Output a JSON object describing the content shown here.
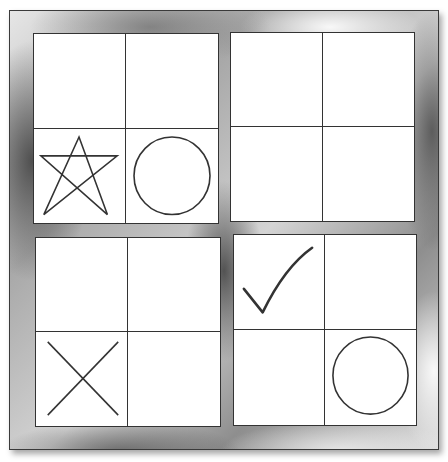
{
  "diagram": {
    "type": "grid-puzzle",
    "frame_color": "#a0a0a0",
    "line_color": "#333333",
    "quadrants": [
      {
        "id": "top-left",
        "cells": [
          {
            "position": "top-left",
            "symbol": ""
          },
          {
            "position": "top-right",
            "symbol": ""
          },
          {
            "position": "bottom-left",
            "symbol": "star"
          },
          {
            "position": "bottom-right",
            "symbol": "circle"
          }
        ]
      },
      {
        "id": "top-right",
        "cells": [
          {
            "position": "top-left",
            "symbol": ""
          },
          {
            "position": "top-right",
            "symbol": ""
          },
          {
            "position": "bottom-left",
            "symbol": ""
          },
          {
            "position": "bottom-right",
            "symbol": ""
          }
        ]
      },
      {
        "id": "bottom-left",
        "cells": [
          {
            "position": "top-left",
            "symbol": ""
          },
          {
            "position": "top-right",
            "symbol": ""
          },
          {
            "position": "bottom-left",
            "symbol": "cross"
          },
          {
            "position": "bottom-right",
            "symbol": ""
          }
        ]
      },
      {
        "id": "bottom-right",
        "cells": [
          {
            "position": "top-left",
            "symbol": "checkmark"
          },
          {
            "position": "top-right",
            "symbol": ""
          },
          {
            "position": "bottom-left",
            "symbol": ""
          },
          {
            "position": "bottom-right",
            "symbol": "circle"
          }
        ]
      }
    ]
  }
}
